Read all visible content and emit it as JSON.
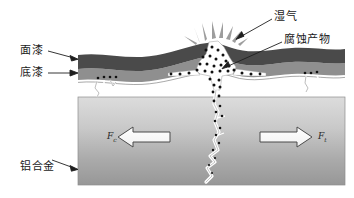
{
  "figure": {
    "type": "schematic-diagram",
    "background_color": "#ffffff"
  },
  "labels": {
    "topcoat": "面漆",
    "primer": "底漆",
    "substrate": "铝合金",
    "moisture": "湿气",
    "corrosion_products": "腐蚀产物"
  },
  "forces": {
    "left": {
      "symbol": "F",
      "subscript": "c"
    },
    "right": {
      "symbol": "F",
      "subscript": "t"
    }
  },
  "colors": {
    "topcoat": "#4a4a4a",
    "primer": "#8f8f8f",
    "substrate_top": "#d6d6d6",
    "substrate_bottom": "#9a9a9a",
    "burst_ray": "#9d9d9d",
    "crack": "#ffffff",
    "corrosion_dot": "#111111",
    "leader_line": "#2a2a2a",
    "outline": "#3a3a3a"
  }
}
